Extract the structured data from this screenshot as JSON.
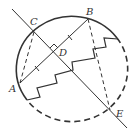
{
  "diagram": {
    "type": "geometry",
    "colors": {
      "stroke": "#333333",
      "background": "#ffffff"
    },
    "points": {
      "A": {
        "label": "A",
        "x": 20,
        "y": 83
      },
      "B": {
        "label": "B",
        "x": 88,
        "y": 19
      },
      "C": {
        "label": "C",
        "x": 34,
        "y": 32
      },
      "D": {
        "label": "D",
        "x": 54,
        "y": 52
      },
      "E": {
        "label": "E",
        "x": 110,
        "y": 110
      }
    },
    "labels": {
      "A": "A",
      "B": "B",
      "C": "C",
      "D": "D",
      "E": "E"
    },
    "elements": [
      {
        "kind": "circle",
        "style": "solid-upper-left / dashed-lower-right"
      },
      {
        "kind": "line",
        "through": [
          "C",
          "E"
        ],
        "style": "solid"
      },
      {
        "kind": "segment",
        "from": "A",
        "to": "B",
        "style": "solid",
        "marks": "equal-length ticks on AD and DB"
      },
      {
        "kind": "segment",
        "from": "C",
        "to": "A",
        "style": "dashed"
      },
      {
        "kind": "segment",
        "from": "B",
        "to": "E",
        "style": "dashed"
      },
      {
        "kind": "right-angle",
        "at": "D"
      },
      {
        "kind": "zigzag",
        "style": "solid staircase"
      }
    ]
  }
}
